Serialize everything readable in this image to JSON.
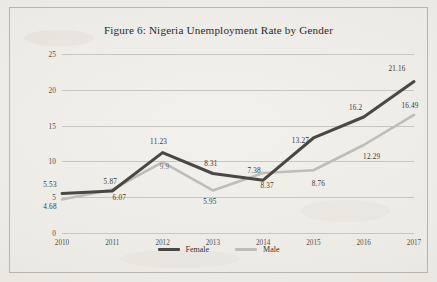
{
  "figure": {
    "title": "Figure 6: Nigeria Unemployment Rate by Gender"
  },
  "legend": {
    "items": [
      {
        "label": "Female",
        "color": "#4a4845"
      },
      {
        "label": "Male",
        "color": "#bfbdb8"
      }
    ]
  },
  "chart_data": {
    "type": "line",
    "title": "Figure 6: Nigeria Unemployment Rate by Gender",
    "xlabel": "",
    "ylabel": "",
    "categories": [
      "2010",
      "2011",
      "2012",
      "2013",
      "2014",
      "2015",
      "2016",
      "2017"
    ],
    "x": [
      2010,
      2011,
      2012,
      2013,
      2014,
      2015,
      2016,
      2017
    ],
    "xlim": [
      2010,
      2017
    ],
    "ylim": [
      0,
      25
    ],
    "yticks": [
      0,
      5,
      10,
      15,
      20,
      25
    ],
    "ytick_labels": [
      "0",
      "5",
      "10",
      "15",
      "20",
      "25"
    ],
    "grid": true,
    "legend_position": "bottom",
    "series": [
      {
        "name": "Female",
        "color": "#4a4845",
        "values": [
          5.53,
          5.87,
          11.23,
          8.31,
          7.38,
          13.27,
          16.2,
          21.16
        ],
        "labels": [
          "5.53",
          "5.87",
          "11.23",
          "8.31",
          "7.38",
          "13.27",
          "16.2",
          "21.16"
        ]
      },
      {
        "name": "Male",
        "color": "#bfbdb8",
        "values": [
          4.68,
          6.07,
          9.9,
          5.95,
          8.37,
          8.76,
          12.29,
          16.49
        ],
        "labels": [
          "4.68",
          "6.07",
          "9.9",
          "5.95",
          "8.37",
          "8.76",
          "12.29",
          "16.49"
        ]
      }
    ]
  }
}
